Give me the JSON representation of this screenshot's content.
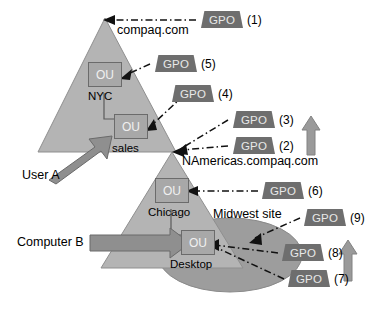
{
  "diagram": {
    "title_text": "Group Policy Object application order",
    "domains": [
      {
        "id": "compaq",
        "label": "compaq.com"
      },
      {
        "id": "namericas",
        "label": "NAmericas.compaq.com"
      }
    ],
    "site": {
      "label": "Midwest site"
    },
    "ous": [
      {
        "id": "nyc",
        "box_label": "OU",
        "name": "NYC"
      },
      {
        "id": "sales",
        "box_label": "OU",
        "name": "sales"
      },
      {
        "id": "chicago",
        "box_label": "OU",
        "name": "Chicago"
      },
      {
        "id": "desktop",
        "box_label": "OU",
        "name": "Desktop"
      }
    ],
    "actors": [
      {
        "id": "user-a",
        "label": "User A"
      },
      {
        "id": "computer-b",
        "label": "Computer B"
      }
    ],
    "gpos": [
      {
        "id": "gpo1",
        "label": "GPO",
        "number": "(1)",
        "target": "compaq.com domain"
      },
      {
        "id": "gpo2",
        "label": "GPO",
        "number": "(2)",
        "target": "NAmericas.compaq.com domain"
      },
      {
        "id": "gpo3",
        "label": "GPO",
        "number": "(3)",
        "target": "NAmericas.compaq.com domain"
      },
      {
        "id": "gpo4",
        "label": "GPO",
        "number": "(4)",
        "target": "sales OU"
      },
      {
        "id": "gpo5",
        "label": "GPO",
        "number": "(5)",
        "target": "NYC OU"
      },
      {
        "id": "gpo6",
        "label": "GPO",
        "number": "(6)",
        "target": "Chicago OU"
      },
      {
        "id": "gpo7",
        "label": "GPO",
        "number": "(7)",
        "target": "Desktop OU"
      },
      {
        "id": "gpo8",
        "label": "GPO",
        "number": "(8)",
        "target": "Desktop OU"
      },
      {
        "id": "gpo9",
        "label": "GPO",
        "number": "(9)",
        "target": "Midwest site"
      }
    ],
    "order_arrows": [
      {
        "id": "order-arrow-upper",
        "direction": "up"
      },
      {
        "id": "order-arrow-lower",
        "direction": "up"
      }
    ],
    "colors": {
      "triangle_fill": "#b4b4b4",
      "triangle_stroke": "#8c8c8c",
      "ellipse_fill": "#9d9d9d",
      "gpo_fill": "#6e6e6e",
      "gpo_text": "#e8e8e8",
      "ou_fill": "#a8a8a8",
      "ou_stroke": "#6b6b6b",
      "block_arrow_fill": "#8f8f8f",
      "block_arrow_stroke": "#6a6a6a",
      "connector_stroke": "#111111",
      "background": "#ffffff",
      "text": "#000000"
    }
  }
}
